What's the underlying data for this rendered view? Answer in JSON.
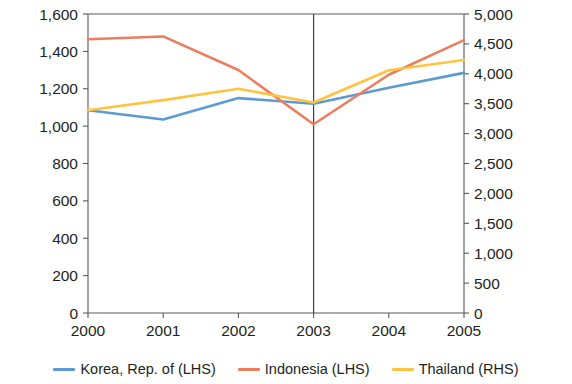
{
  "chart_data": {
    "type": "line",
    "title": "",
    "subtitle": "",
    "xlabel": "",
    "ylabel": "",
    "categories": [
      "2000",
      "2001",
      "2002",
      "2003",
      "2004",
      "2005"
    ],
    "x_tick_labels": [
      "2000",
      "2001",
      "2002",
      "2003",
      "2004",
      "2005"
    ],
    "y_left_axis": {
      "label": "",
      "ylim": [
        0,
        1600
      ],
      "tick_step": 200,
      "tick_labels": [
        "0",
        "200",
        "400",
        "600",
        "800",
        "1,000",
        "1,200",
        "1,400",
        "1,600"
      ],
      "tick_values": [
        0,
        200,
        400,
        600,
        800,
        1000,
        1200,
        1400,
        1600
      ]
    },
    "y_right_axis": {
      "label": "",
      "ylim": [
        0,
        5000
      ],
      "tick_step": 500,
      "tick_labels": [
        "0",
        "500",
        "1,000",
        "1,500",
        "2,000",
        "2,500",
        "3,000",
        "3,500",
        "4,000",
        "4,500",
        "5,000"
      ],
      "tick_values": [
        0,
        500,
        1000,
        1500,
        2000,
        2500,
        3000,
        3500,
        4000,
        4500,
        5000
      ]
    },
    "grid": false,
    "legend_position": "bottom",
    "annotations": [
      {
        "name": "vertical-divider",
        "x": "2003"
      }
    ],
    "series": [
      {
        "name": "Korea, Rep. of (LHS)",
        "axis": "left",
        "color": "#5B9BD5",
        "values": [
          1085,
          1035,
          1150,
          1120,
          1205,
          1285
        ]
      },
      {
        "name": "Indonesia (LHS)",
        "axis": "left",
        "color": "#ED7D5F",
        "values": [
          1465,
          1480,
          1300,
          1010,
          1275,
          1460
        ]
      },
      {
        "name": "Thailand (RHS)",
        "axis": "right",
        "color": "#FFC342",
        "values": [
          3390,
          3560,
          3750,
          3520,
          4060,
          4230
        ]
      }
    ]
  },
  "legend": {
    "entries": [
      {
        "label": "Korea, Rep. of (LHS)",
        "color": "#5B9BD5"
      },
      {
        "label": "Indonesia (LHS)",
        "color": "#ED7D5F"
      },
      {
        "label": "Thailand (RHS)",
        "color": "#FFC342"
      }
    ]
  }
}
